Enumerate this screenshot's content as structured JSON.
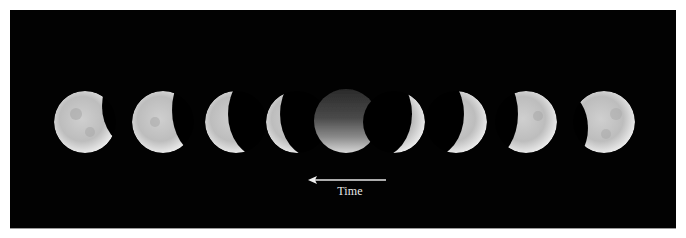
{
  "figure": {
    "background_color": "#020202",
    "moon_color": "#d9d9d9",
    "moons": [
      {
        "index": 1,
        "phase": "mostly lit, shadow on right edge"
      },
      {
        "index": 2,
        "phase": "half lit, shadow on right"
      },
      {
        "index": 3,
        "phase": "crescent lit on left"
      },
      {
        "index": 4,
        "phase": "thin crescent lit on left"
      },
      {
        "index": 5,
        "phase": "totality, darkened disk"
      },
      {
        "index": 6,
        "phase": "thin crescent lit on right"
      },
      {
        "index": 7,
        "phase": "crescent lit on right"
      },
      {
        "index": 8,
        "phase": "mostly lit, shadow on left"
      },
      {
        "index": 9,
        "phase": "nearly full, small shadow on lower left"
      }
    ]
  },
  "annotation": {
    "arrow_direction": "left",
    "arrow_icon": "left-arrow-icon",
    "label": "Time"
  }
}
